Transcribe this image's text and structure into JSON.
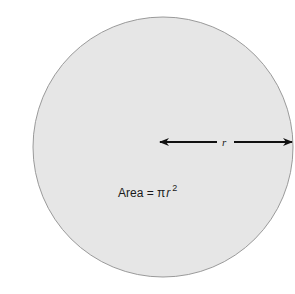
{
  "diagram": {
    "circle": {
      "fill": "#e6e6e6",
      "stroke": "#9a9a9a"
    },
    "radius_label": "r",
    "formula": {
      "prefix": "Area = ",
      "pi": "π",
      "var": "r",
      "exponent": "2"
    },
    "arrow_color": "#111111"
  }
}
